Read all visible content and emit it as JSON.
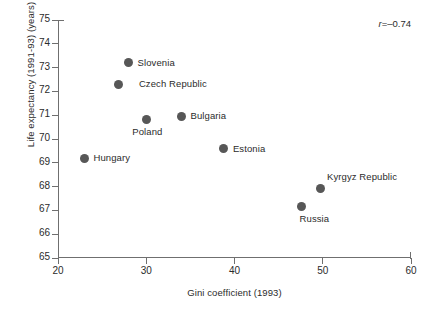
{
  "chart_data": {
    "type": "scatter",
    "title": "",
    "xlabel": "Gini coefficient (1993)",
    "ylabel": "Life expectancy (1991-93) (years)",
    "xlim": [
      20,
      60
    ],
    "ylim": [
      65,
      75
    ],
    "xticks": [
      "20",
      "30",
      "40",
      "50",
      "60"
    ],
    "xtick_values": [
      20,
      30,
      40,
      50,
      60
    ],
    "yticks": [
      "75",
      "74",
      "73",
      "72",
      "71",
      "70",
      "69",
      "68",
      "67",
      "66",
      "65"
    ],
    "ytick_values": [
      75,
      74,
      73,
      72,
      71,
      70,
      69,
      68,
      67,
      66,
      65
    ],
    "grid": false,
    "legend": null,
    "annotation": "r=–0.74",
    "annotation_symbol": "r",
    "annotation_value": "=–0.74",
    "marker_color": "#575757",
    "axis_color": "#6f6f6f",
    "points": [
      {
        "label": "Slovenia",
        "x": 28.0,
        "y": 73.2,
        "label_pos": "right"
      },
      {
        "label": "Czech Republic",
        "x": 26.9,
        "y": 72.3,
        "label_pos": "right-far"
      },
      {
        "label": "Bulgaria",
        "x": 34.0,
        "y": 70.95,
        "label_pos": "right"
      },
      {
        "label": "Poland",
        "x": 30.0,
        "y": 70.8,
        "label_pos": "below-left"
      },
      {
        "label": "Estonia",
        "x": 38.8,
        "y": 69.6,
        "label_pos": "right"
      },
      {
        "label": "Hungary",
        "x": 23.0,
        "y": 69.2,
        "label_pos": "right"
      },
      {
        "label": "Kyrgyz Republic",
        "x": 49.8,
        "y": 67.9,
        "label_pos": "above-right"
      },
      {
        "label": "Russia",
        "x": 47.6,
        "y": 67.15,
        "label_pos": "below-right"
      }
    ]
  }
}
